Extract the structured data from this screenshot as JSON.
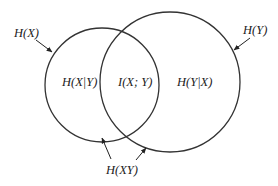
{
  "diagram": {
    "type": "venn",
    "colors": {
      "stroke": "#333333",
      "text": "#222222",
      "background": "#ffffff"
    },
    "sets": [
      {
        "id": "X",
        "label": "H(X)",
        "cx": 102,
        "cy": 85,
        "r": 57
      },
      {
        "id": "Y",
        "label": "H(Y)",
        "cx": 170,
        "cy": 82,
        "r": 70
      }
    ],
    "regions": {
      "x_only": "H(X|Y)",
      "intersection": "I(X; Y)",
      "y_only": "H(Y|X)"
    },
    "labels": {
      "hx": "H(X)",
      "hy": "H(Y)",
      "hxy": "H(XY)"
    }
  }
}
